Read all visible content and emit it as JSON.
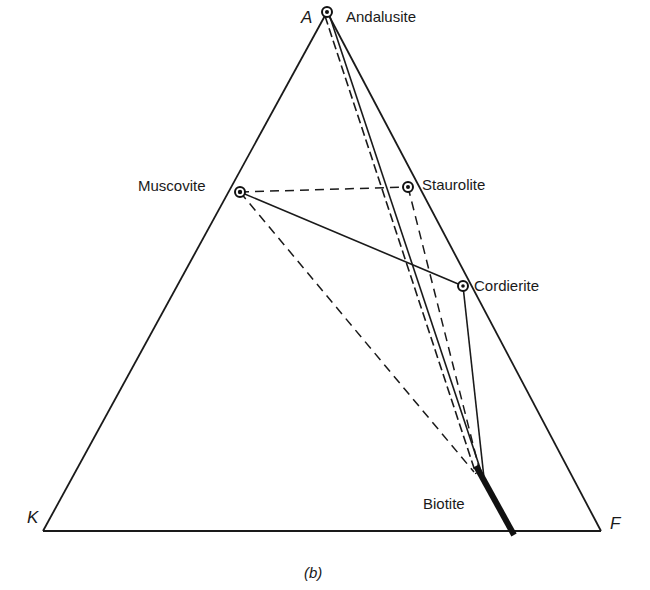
{
  "diagram": {
    "type": "ternary phase diagram (AKF)",
    "caption": "(b)",
    "corners": {
      "top": "A",
      "left": "K",
      "right": "F"
    },
    "minerals": [
      {
        "name": "Andalusite",
        "role": "apex point"
      },
      {
        "name": "Muscovite",
        "role": "phase point"
      },
      {
        "name": "Staurolite",
        "role": "phase point"
      },
      {
        "name": "Cordierite",
        "role": "phase point"
      },
      {
        "name": "Biotite",
        "role": "solid-solution band"
      }
    ],
    "tie_lines": [
      {
        "from": "Andalusite",
        "to": "Biotite",
        "style": "solid"
      },
      {
        "from": "Andalusite",
        "to": "Biotite",
        "style": "dashed"
      },
      {
        "from": "Muscovite",
        "to": "Staurolite",
        "style": "dashed"
      },
      {
        "from": "Muscovite",
        "to": "Cordierite",
        "style": "solid"
      },
      {
        "from": "Muscovite",
        "to": "Biotite",
        "style": "dashed"
      },
      {
        "from": "Staurolite",
        "to": "Biotite",
        "style": "dashed"
      },
      {
        "from": "Cordierite",
        "to": "Biotite",
        "style": "solid"
      }
    ]
  }
}
